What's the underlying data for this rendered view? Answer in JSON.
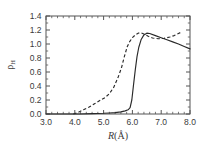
{
  "chart_data": {
    "type": "line",
    "title": "",
    "subtitle": "",
    "xlabel": "R(Å)",
    "ylabel": "ρ",
    "ylabel_subscript": "H",
    "xlim": [
      3.0,
      8.0
    ],
    "ylim": [
      0.0,
      1.4
    ],
    "xticks": [
      3.0,
      4.0,
      5.0,
      6.0,
      7.0,
      8.0
    ],
    "xticklabels": [
      "3.0",
      "4.0",
      "5.0",
      "6.0",
      "7.0",
      "8.0"
    ],
    "yticks": [
      0.0,
      0.2,
      0.4,
      0.6,
      0.8,
      1.0,
      1.2,
      1.4
    ],
    "yticklabels": [
      "0.0",
      "0.2",
      "0.4",
      "0.6",
      "0.8",
      "1.0",
      "1.2",
      "1.4"
    ],
    "x_minor_tick_step": 0.2,
    "y_minor_tick_step": 0.1,
    "grid": false,
    "legend": "none",
    "frame": "box",
    "series": [
      {
        "name": "solid-curve",
        "style": "solid",
        "color": "#2a2a2a",
        "x": [
          3.0,
          3.4,
          3.8,
          4.2,
          4.6,
          5.0,
          5.2,
          5.4,
          5.6,
          5.75,
          5.85,
          5.92,
          5.98,
          6.04,
          6.1,
          6.16,
          6.22,
          6.3,
          6.4,
          6.5,
          6.6,
          6.8,
          7.0,
          7.2,
          7.4,
          7.6,
          7.8,
          8.0
        ],
        "y": [
          0.0,
          0.0,
          0.0,
          0.0,
          0.005,
          0.01,
          0.015,
          0.02,
          0.03,
          0.045,
          0.06,
          0.09,
          0.2,
          0.42,
          0.63,
          0.82,
          0.95,
          1.06,
          1.13,
          1.155,
          1.15,
          1.12,
          1.09,
          1.06,
          1.03,
          1.0,
          0.965,
          0.93
        ]
      },
      {
        "name": "dashed-curve",
        "style": "dashed",
        "color": "#2a2a2a",
        "x": [
          3.95,
          4.1,
          4.3,
          4.5,
          4.7,
          4.9,
          5.05,
          5.2,
          5.35,
          5.5,
          5.62,
          5.72,
          5.82,
          5.9,
          6.0,
          6.1,
          6.2,
          6.3,
          6.42,
          6.55,
          6.7,
          6.9,
          7.1,
          7.3,
          7.45,
          7.6,
          7.7
        ],
        "y": [
          0.0,
          0.02,
          0.06,
          0.1,
          0.15,
          0.2,
          0.235,
          0.29,
          0.38,
          0.52,
          0.66,
          0.82,
          0.96,
          1.03,
          1.09,
          1.13,
          1.155,
          1.16,
          1.14,
          1.11,
          1.085,
          1.075,
          1.08,
          1.1,
          1.12,
          1.15,
          1.17
        ]
      }
    ],
    "annotations": []
  },
  "colors": {
    "background": "#ffffff",
    "axis": "#555555",
    "text": "#3a3a3a",
    "curve": "#2a2a2a"
  }
}
